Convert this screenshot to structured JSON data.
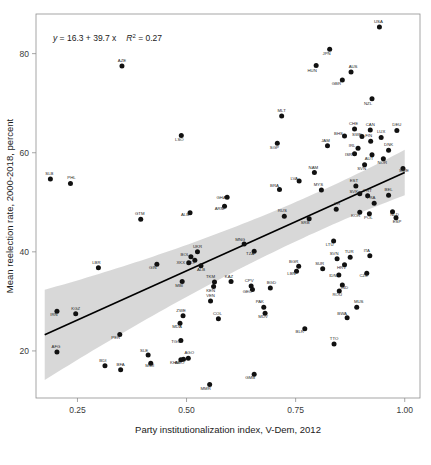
{
  "chart_data": {
    "type": "scatter",
    "title": "",
    "xlabel": "Party institutionalization index, V-Dem, 2012",
    "ylabel": "Mean reelection rate, 2000-2018, percent",
    "xlim": [
      0.155,
      1.035
    ],
    "ylim": [
      10.5,
      88.0
    ],
    "xticks": [
      0.25,
      0.5,
      0.75,
      1.0
    ],
    "xtick_labels": [
      "0.25",
      "0.50",
      "0.75",
      "1.00"
    ],
    "yticks": [
      20,
      40,
      60,
      80
    ],
    "ytick_labels": [
      "20",
      "40",
      "60",
      "80"
    ],
    "grid": false,
    "legend": "none",
    "annotation": {
      "equation_lhs": "y",
      "equation_body": " = 16.3 + 39.7 x",
      "r_symbol": "R",
      "r_exponent": "2",
      "r_value": " = 0.27",
      "full_text": "y = 16.3 + 39.7 x   R2 = 0.27"
    },
    "fit": {
      "type": "linear",
      "intercept": 16.3,
      "slope": 39.7,
      "r_squared": 0.27,
      "ci_band": true,
      "ci_x": [
        0.175,
        1.0
      ],
      "ci_lower_at_xmin": 15.2,
      "ci_upper_at_xmin": 29.8,
      "ci_lower_at_xmax": 53.2,
      "ci_upper_at_xmax": 58.8
    },
    "point_label_field": "iso3",
    "points": [
      {
        "iso3": "USA",
        "x": 0.942,
        "y": 85.4,
        "lx": -1,
        "ly": -4
      },
      {
        "iso3": "JPN",
        "x": 0.828,
        "y": 80.9,
        "lx": -3,
        "ly": 6
      },
      {
        "iso3": "HUN",
        "x": 0.797,
        "y": 77.6,
        "lx": -4,
        "ly": 6
      },
      {
        "iso3": "AZE",
        "x": 0.352,
        "y": 77.5,
        "lx": 0,
        "ly": -4
      },
      {
        "iso3": "AUS",
        "x": 0.877,
        "y": 76.3,
        "lx": 2,
        "ly": -4
      },
      {
        "iso3": "GBR",
        "x": 0.857,
        "y": 74.7,
        "lx": -6,
        "ly": 5
      },
      {
        "iso3": "NZL",
        "x": 0.925,
        "y": 70.9,
        "lx": -4,
        "ly": 6
      },
      {
        "iso3": "MLT",
        "x": 0.718,
        "y": 67.4,
        "lx": 0,
        "ly": -4
      },
      {
        "iso3": "CHE",
        "x": 0.885,
        "y": 64.8,
        "lx": -1,
        "ly": -4
      },
      {
        "iso3": "CAN",
        "x": 0.921,
        "y": 64.6,
        "lx": 0,
        "ly": -4
      },
      {
        "iso3": "DEU",
        "x": 0.982,
        "y": 64.5,
        "lx": 0,
        "ly": -4
      },
      {
        "iso3": "LSO",
        "x": 0.488,
        "y": 63.5,
        "lx": -2,
        "ly": 6
      },
      {
        "iso3": "BHS",
        "x": 0.862,
        "y": 63.4,
        "lx": -6,
        "ly": -1
      },
      {
        "iso3": "LUX",
        "x": 0.946,
        "y": 63.1,
        "lx": 0,
        "ly": -4
      },
      {
        "iso3": "SWE",
        "x": 0.902,
        "y": 63.3,
        "lx": -5,
        "ly": 0
      },
      {
        "iso3": "FIN",
        "x": 0.922,
        "y": 62.3,
        "lx": -2,
        "ly": -4
      },
      {
        "iso3": "SGP",
        "x": 0.708,
        "y": 61.9,
        "lx": -3,
        "ly": 6
      },
      {
        "iso3": "IRL",
        "x": 0.893,
        "y": 60.9,
        "lx": -6,
        "ly": -1
      },
      {
        "iso3": "JAM",
        "x": 0.823,
        "y": 61.4,
        "lx": -2,
        "ly": -4
      },
      {
        "iso3": "DNK",
        "x": 0.963,
        "y": 60.5,
        "lx": 0,
        "ly": -4
      },
      {
        "iso3": "ISR",
        "x": 0.885,
        "y": 59.8,
        "lx": -6,
        "ly": 2
      },
      {
        "iso3": "AUT",
        "x": 0.925,
        "y": 59.6,
        "lx": -3,
        "ly": 5
      },
      {
        "iso3": "NOR",
        "x": 0.951,
        "y": 58.8,
        "lx": -1,
        "ly": 5
      },
      {
        "iso3": "SVN",
        "x": 0.908,
        "y": 57.6,
        "lx": -3,
        "ly": 5
      },
      {
        "iso3": "SWE2",
        "x": 0.996,
        "y": 56.8,
        "lx": 1,
        "ly": 3
      },
      {
        "iso3": "NAM",
        "x": 0.793,
        "y": 56.0,
        "lx": -1,
        "ly": -4
      },
      {
        "iso3": "SLB",
        "x": 0.188,
        "y": 54.7,
        "lx": -1,
        "ly": -4
      },
      {
        "iso3": "LVA",
        "x": 0.758,
        "y": 54.3,
        "lx": -5,
        "ly": -1
      },
      {
        "iso3": "PHL",
        "x": 0.234,
        "y": 53.8,
        "lx": 1,
        "ly": -4
      },
      {
        "iso3": "EST",
        "x": 0.888,
        "y": 53.3,
        "lx": -2,
        "ly": -4
      },
      {
        "iso3": "BRA",
        "x": 0.713,
        "y": 52.6,
        "lx": -5,
        "ly": -2
      },
      {
        "iso3": "MYS",
        "x": 0.809,
        "y": 52.5,
        "lx": -3,
        "ly": -4
      },
      {
        "iso3": "SVK",
        "x": 0.897,
        "y": 51.7,
        "lx": -6,
        "ly": -1
      },
      {
        "iso3": "PRT",
        "x": 0.915,
        "y": 51.3,
        "lx": 0,
        "ly": -4
      },
      {
        "iso3": "BEL",
        "x": 0.963,
        "y": 51.4,
        "lx": 0,
        "ly": -4
      },
      {
        "iso3": "GHA",
        "x": 0.593,
        "y": 51.0,
        "lx": -6,
        "ly": 2
      },
      {
        "iso3": "FRA",
        "x": 0.93,
        "y": 49.8,
        "lx": -3,
        "ly": -4
      },
      {
        "iso3": "ARM",
        "x": 0.587,
        "y": 49.2,
        "lx": -5,
        "ly": 4
      },
      {
        "iso3": "YR",
        "x": 0.843,
        "y": 48.6,
        "lx": 1,
        "ly": -4
      },
      {
        "iso3": "ALB",
        "x": 0.508,
        "y": 47.9,
        "lx": -5,
        "ly": 3
      },
      {
        "iso3": "KOR",
        "x": 0.897,
        "y": 48.0,
        "lx": -4,
        "ly": 5
      },
      {
        "iso3": "POL",
        "x": 0.919,
        "y": 47.7,
        "lx": -1,
        "ly": 5
      },
      {
        "iso3": "RUS",
        "x": 0.724,
        "y": 47.2,
        "lx": -2,
        "ly": -4
      },
      {
        "iso3": "NLD",
        "x": 0.972,
        "y": 48.1,
        "lx": 2,
        "ly": 4
      },
      {
        "iso3": "SRB",
        "x": 0.781,
        "y": 46.7,
        "lx": -4,
        "ly": 5
      },
      {
        "iso3": "GTM",
        "x": 0.395,
        "y": 46.6,
        "lx": -1,
        "ly": -4
      },
      {
        "iso3": "ESP",
        "x": 0.98,
        "y": 46.9,
        "lx": 1,
        "ly": 5
      },
      {
        "iso3": "LTU",
        "x": 0.837,
        "y": 42.2,
        "lx": -4,
        "ly": 5
      },
      {
        "iso3": "MNG",
        "x": 0.632,
        "y": 41.6,
        "lx": -4,
        "ly": -3
      },
      {
        "iso3": "TZA",
        "x": 0.655,
        "y": 40.1,
        "lx": -4,
        "ly": 4
      },
      {
        "iso3": "UKR",
        "x": 0.525,
        "y": 40.0,
        "lx": 0,
        "ly": -4
      },
      {
        "iso3": "ITA",
        "x": 0.92,
        "y": 39.2,
        "lx": -3,
        "ly": -4
      },
      {
        "iso3": "BOL",
        "x": 0.51,
        "y": 39.0,
        "lx": -6,
        "ly": -1
      },
      {
        "iso3": "TUR",
        "x": 0.875,
        "y": 38.9,
        "lx": -1,
        "ly": -4
      },
      {
        "iso3": "SVN2",
        "x": 0.845,
        "y": 38.6,
        "lx": -3,
        "ly": -4
      },
      {
        "iso3": "MLI",
        "x": 0.519,
        "y": 38.3,
        "lx": -4,
        "ly": 4
      },
      {
        "iso3": "GIN",
        "x": 0.432,
        "y": 37.5,
        "lx": -4,
        "ly": 5
      },
      {
        "iso3": "XKX",
        "x": 0.505,
        "y": 37.8,
        "lx": -8,
        "ly": 1
      },
      {
        "iso3": "HRV",
        "x": 0.862,
        "y": 37.4,
        "lx": -3,
        "ly": 4
      },
      {
        "iso3": "BGR",
        "x": 0.757,
        "y": 37.1,
        "lx": -5,
        "ly": -3
      },
      {
        "iso3": "SUR",
        "x": 0.812,
        "y": 36.6,
        "lx": -3,
        "ly": -4
      },
      {
        "iso3": "ALB2",
        "x": 0.533,
        "y": 37.2,
        "lx": 0,
        "ly": 5
      },
      {
        "iso3": "LBR",
        "x": 0.298,
        "y": 36.8,
        "lx": -2,
        "ly": -4
      },
      {
        "iso3": "LBN",
        "x": 0.752,
        "y": 36.1,
        "lx": -5,
        "ly": 4
      },
      {
        "iso3": "CZE",
        "x": 0.913,
        "y": 35.7,
        "lx": -3,
        "ly": 4
      },
      {
        "iso3": "IDN",
        "x": 0.849,
        "y": 35.3,
        "lx": -6,
        "ly": 2
      },
      {
        "iso3": "KAZ",
        "x": 0.602,
        "y": 34.0,
        "lx": -2,
        "ly": -4
      },
      {
        "iso3": "MBI",
        "x": 0.49,
        "y": 34.0,
        "lx": -3,
        "ly": 5
      },
      {
        "iso3": "TKM",
        "x": 0.564,
        "y": 33.9,
        "lx": -4,
        "ly": -4
      },
      {
        "iso3": "IND",
        "x": 0.857,
        "y": 33.3,
        "lx": 2,
        "ly": 4
      },
      {
        "iso3": "KEN",
        "x": 0.562,
        "y": 33.0,
        "lx": -3,
        "ly": 5
      },
      {
        "iso3": "CPV",
        "x": 0.648,
        "y": 33.1,
        "lx": -2,
        "ly": -4
      },
      {
        "iso3": "BGD",
        "x": 0.692,
        "y": 32.7,
        "lx": 1,
        "ly": -4
      },
      {
        "iso3": "ROU",
        "x": 0.85,
        "y": 32.1,
        "lx": -2,
        "ly": 5
      },
      {
        "iso3": "GEO",
        "x": 0.651,
        "y": 32.4,
        "lx": -5,
        "ly": 4
      },
      {
        "iso3": "VEN",
        "x": 0.555,
        "y": 30.1,
        "lx": 0,
        "ly": -4
      },
      {
        "iso3": "PAK",
        "x": 0.677,
        "y": 28.8,
        "lx": -4,
        "ly": -4
      },
      {
        "iso3": "MUS",
        "x": 0.89,
        "y": 28.8,
        "lx": 2,
        "ly": -4
      },
      {
        "iso3": "IRN",
        "x": 0.203,
        "y": 28.0,
        "lx": -3,
        "ly": 5
      },
      {
        "iso3": "KGZ",
        "x": 0.246,
        "y": 27.5,
        "lx": 0,
        "ly": -4
      },
      {
        "iso3": "MDV",
        "x": 0.68,
        "y": 27.6,
        "lx": -2,
        "ly": 5
      },
      {
        "iso3": "ZWE",
        "x": 0.492,
        "y": 27.1,
        "lx": -2,
        "ly": -4
      },
      {
        "iso3": "BWA",
        "x": 0.868,
        "y": 26.7,
        "lx": -5,
        "ly": -3
      },
      {
        "iso3": "COL",
        "x": 0.573,
        "y": 26.5,
        "lx": -1,
        "ly": -4
      },
      {
        "iso3": "MDA",
        "x": 0.485,
        "y": 25.6,
        "lx": -3,
        "ly": 5
      },
      {
        "iso3": "BLR",
        "x": 0.771,
        "y": 24.5,
        "lx": -5,
        "ly": 4
      },
      {
        "iso3": "PER",
        "x": 0.347,
        "y": 23.3,
        "lx": -4,
        "ly": 4
      },
      {
        "iso3": "TGO",
        "x": 0.487,
        "y": 22.1,
        "lx": -5,
        "ly": 2
      },
      {
        "iso3": "TTO",
        "x": 0.838,
        "y": 21.4,
        "lx": 0,
        "ly": -4
      },
      {
        "iso3": "AFG",
        "x": 0.203,
        "y": 19.8,
        "lx": -1,
        "ly": -4
      },
      {
        "iso3": "SLE",
        "x": 0.412,
        "y": 19.2,
        "lx": -4,
        "ly": -3
      },
      {
        "iso3": "AGO",
        "x": 0.504,
        "y": 18.5,
        "lx": 1,
        "ly": -4
      },
      {
        "iso3": "AGO2",
        "x": 0.493,
        "y": 18.3,
        "lx": -4,
        "ly": 5
      },
      {
        "iso3": "KHM",
        "x": 0.487,
        "y": 18.2,
        "lx": -6,
        "ly": 4
      },
      {
        "iso3": "MWI",
        "x": 0.418,
        "y": 17.5,
        "lx": -1,
        "ly": 4
      },
      {
        "iso3": "BDI",
        "x": 0.313,
        "y": 17.0,
        "lx": -2,
        "ly": -4
      },
      {
        "iso3": "BFA",
        "x": 0.349,
        "y": 16.2,
        "lx": 0,
        "ly": -4
      },
      {
        "iso3": "GMB",
        "x": 0.655,
        "y": 15.3,
        "lx": -4,
        "ly": 5
      },
      {
        "iso3": "MMR",
        "x": 0.553,
        "y": 13.2,
        "lx": -4,
        "ly": 5
      }
    ]
  }
}
